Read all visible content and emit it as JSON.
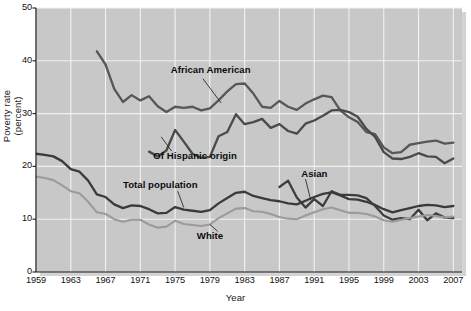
{
  "chart_data": {
    "type": "line",
    "title": "",
    "xlabel": "Year",
    "ylabel": "Poverty rate (percent)",
    "xlim": [
      1959,
      2008
    ],
    "ylim": [
      0,
      50
    ],
    "ytick_labels": [
      "0",
      "10",
      "20",
      "30",
      "40",
      "50"
    ],
    "ytick_values": [
      0,
      10,
      20,
      30,
      40,
      50
    ],
    "xtick_labels": [
      "1959",
      "1963",
      "1967",
      "1971",
      "1975",
      "1979",
      "1983",
      "1987",
      "1991",
      "1995",
      "1999",
      "2003",
      "2007"
    ],
    "xtick_values": [
      1959,
      1963,
      1967,
      1971,
      1975,
      1979,
      1983,
      1987,
      1991,
      1995,
      1999,
      2003,
      2007
    ],
    "grid": "white gridlines on gray panel, vertical at each xtick, horizontal at each ytick",
    "legend_position": "inline annotations with leader lines",
    "panel_color": "#c8c8c8",
    "grid_color": "#f2f2f2",
    "series": [
      {
        "name": "African American",
        "color": "#575757",
        "label_position": "inline",
        "x": [
          1966,
          1967,
          1968,
          1969,
          1970,
          1971,
          1972,
          1973,
          1974,
          1975,
          1976,
          1977,
          1978,
          1979,
          1980,
          1981,
          1982,
          1983,
          1984,
          1985,
          1986,
          1987,
          1988,
          1989,
          1990,
          1991,
          1992,
          1993,
          1994,
          1995,
          1996,
          1997,
          1998,
          1999,
          2000,
          2001,
          2002,
          2003,
          2004,
          2005,
          2006,
          2007
        ],
        "values": [
          41.8,
          39.3,
          34.7,
          32.2,
          33.5,
          32.5,
          33.3,
          31.4,
          30.3,
          31.3,
          31.1,
          31.3,
          30.6,
          31.0,
          32.5,
          34.2,
          35.6,
          35.7,
          33.8,
          31.3,
          31.1,
          32.4,
          31.3,
          30.7,
          31.9,
          32.7,
          33.4,
          33.1,
          30.6,
          29.3,
          28.4,
          26.5,
          26.1,
          23.6,
          22.5,
          22.7,
          24.1,
          24.4,
          24.7,
          24.9,
          24.3,
          24.5
        ]
      },
      {
        "name": "Of Hispanic origin",
        "color": "#4a4a4a",
        "label_position": "inline",
        "x": [
          1972,
          1973,
          1974,
          1975,
          1976,
          1977,
          1978,
          1979,
          1980,
          1981,
          1982,
          1983,
          1984,
          1985,
          1986,
          1987,
          1988,
          1989,
          1990,
          1991,
          1992,
          1993,
          1994,
          1995,
          1996,
          1997,
          1998,
          1999,
          2000,
          2001,
          2002,
          2003,
          2004,
          2005,
          2006,
          2007
        ],
        "values": [
          22.8,
          21.9,
          23.0,
          26.9,
          24.7,
          22.4,
          21.6,
          21.8,
          25.7,
          26.5,
          29.9,
          28.0,
          28.4,
          29.0,
          27.3,
          28.0,
          26.7,
          26.2,
          28.1,
          28.7,
          29.6,
          30.6,
          30.7,
          30.3,
          29.4,
          27.1,
          25.6,
          22.7,
          21.5,
          21.4,
          21.8,
          22.5,
          21.9,
          21.8,
          20.6,
          21.5
        ]
      },
      {
        "name": "Asian",
        "color": "#3d3d3d",
        "label_position": "inline",
        "x": [
          1987,
          1988,
          1989,
          1990,
          1991,
          1992,
          1993,
          1994,
          1995,
          1996,
          1997,
          1998,
          1999,
          2000,
          2001,
          2002,
          2003,
          2004,
          2005,
          2006,
          2007
        ],
        "values": [
          16.1,
          17.3,
          14.1,
          12.2,
          13.8,
          12.5,
          15.3,
          14.6,
          14.6,
          14.5,
          14.0,
          12.5,
          10.7,
          9.9,
          10.2,
          10.0,
          11.8,
          9.8,
          11.1,
          10.3,
          10.2
        ]
      },
      {
        "name": "Total population",
        "color": "#3a3a3a",
        "label_position": "inline",
        "x": [
          1959,
          1960,
          1961,
          1962,
          1963,
          1964,
          1965,
          1966,
          1967,
          1968,
          1969,
          1970,
          1971,
          1972,
          1973,
          1974,
          1975,
          1976,
          1977,
          1978,
          1979,
          1980,
          1981,
          1982,
          1983,
          1984,
          1985,
          1986,
          1987,
          1988,
          1989,
          1990,
          1991,
          1992,
          1993,
          1994,
          1995,
          1996,
          1997,
          1998,
          1999,
          2000,
          2001,
          2002,
          2003,
          2004,
          2005,
          2006,
          2007
        ],
        "values": [
          22.4,
          22.2,
          21.9,
          21.0,
          19.5,
          19.0,
          17.3,
          14.7,
          14.2,
          12.8,
          12.1,
          12.6,
          12.5,
          11.9,
          11.1,
          11.2,
          12.3,
          11.8,
          11.6,
          11.4,
          11.7,
          13.0,
          14.0,
          15.0,
          15.2,
          14.4,
          14.0,
          13.6,
          13.4,
          13.0,
          12.8,
          13.5,
          14.2,
          14.8,
          15.1,
          14.5,
          13.8,
          13.7,
          13.3,
          12.7,
          11.9,
          11.3,
          11.7,
          12.1,
          12.5,
          12.7,
          12.6,
          12.3,
          12.5
        ]
      },
      {
        "name": "White",
        "color": "#9b9b9b",
        "label_position": "inline",
        "x": [
          1959,
          1960,
          1961,
          1962,
          1963,
          1964,
          1965,
          1966,
          1967,
          1968,
          1969,
          1970,
          1971,
          1972,
          1973,
          1974,
          1975,
          1976,
          1977,
          1978,
          1979,
          1980,
          1981,
          1982,
          1983,
          1984,
          1985,
          1986,
          1987,
          1988,
          1989,
          1990,
          1991,
          1992,
          1993,
          1994,
          1995,
          1996,
          1997,
          1998,
          1999,
          2000,
          2001,
          2002,
          2003,
          2004,
          2005,
          2006,
          2007
        ],
        "values": [
          18.1,
          17.8,
          17.4,
          16.4,
          15.3,
          14.9,
          13.3,
          11.3,
          11.0,
          10.0,
          9.5,
          9.9,
          9.9,
          9.0,
          8.4,
          8.6,
          9.7,
          9.1,
          8.9,
          8.7,
          9.0,
          10.2,
          11.1,
          12.0,
          12.1,
          11.5,
          11.4,
          11.0,
          10.4,
          10.1,
          10.0,
          10.7,
          11.3,
          11.9,
          12.2,
          11.7,
          11.2,
          11.2,
          11.0,
          10.5,
          9.8,
          9.5,
          9.9,
          10.2,
          10.5,
          10.8,
          10.6,
          10.3,
          10.5
        ]
      }
    ],
    "annotations": [
      {
        "text": "African American",
        "x": 1974.5,
        "y": 38.2
      },
      {
        "text": "Of Hispanic origin",
        "x": 1972.5,
        "y": 22.0
      },
      {
        "text": "Total population",
        "x": 1969.0,
        "y": 16.4
      },
      {
        "text": "White",
        "x": 1977.5,
        "y": 6.9
      },
      {
        "text": "Asian",
        "x": 1989.5,
        "y": 18.6
      }
    ]
  }
}
